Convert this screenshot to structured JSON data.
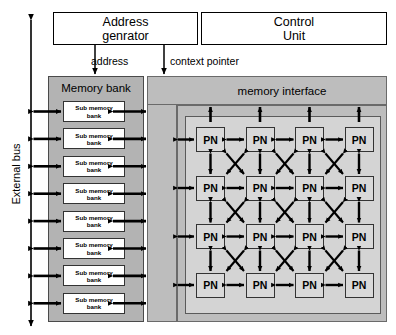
{
  "diagram": {
    "colors": {
      "gray_dark": "#b3b3b3",
      "gray_mid": "#bdbdbd",
      "gray_light": "#d4d4d4",
      "pn_fill": "#d9d9d9",
      "stroke": "#000000",
      "background": "#ffffff"
    }
  },
  "units": {
    "address_generator": {
      "line1": "Address",
      "line2": "genrator"
    },
    "control_unit": {
      "line1": "Control",
      "line2": "Unit"
    }
  },
  "signals": {
    "address": "address",
    "context_pointer": "context pointer"
  },
  "buses": {
    "external_bus": "External bus"
  },
  "memory_bank": {
    "title": "Memory bank",
    "sub_bank_label_line1": "Sub memory",
    "sub_bank_label_line2": "bank",
    "sub_bank_count": 8,
    "sub_banks": [
      {
        "line1": "Sub memory",
        "line2": "bank"
      },
      {
        "line1": "Sub memory",
        "line2": "bank"
      },
      {
        "line1": "Sub memory",
        "line2": "bank"
      },
      {
        "line1": "Sub memory",
        "line2": "bank"
      },
      {
        "line1": "Sub memory",
        "line2": "bank"
      },
      {
        "line1": "Sub memory",
        "line2": "bank"
      },
      {
        "line1": "Sub memory",
        "line2": "bank"
      },
      {
        "line1": "Sub memory",
        "line2": "bank"
      }
    ]
  },
  "memory_interface": {
    "title": "memory interface"
  },
  "pn_array": {
    "node_label": "PN",
    "rows": 4,
    "cols": 4,
    "total_nodes": 16,
    "nodes": [
      [
        "PN",
        "PN",
        "PN",
        "PN"
      ],
      [
        "PN",
        "PN",
        "PN",
        "PN"
      ],
      [
        "PN",
        "PN",
        "PN",
        "PN"
      ],
      [
        "PN",
        "PN",
        "PN",
        "PN"
      ]
    ],
    "connection_types": [
      "horizontal-bidirectional",
      "vertical-bidirectional",
      "diagonal-crossbar-bidirectional"
    ]
  }
}
